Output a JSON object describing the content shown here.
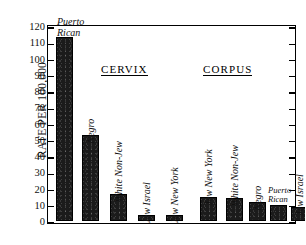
{
  "chart_data": {
    "type": "bar",
    "title": "",
    "xlabel": "",
    "ylabel": "RATE PER 100,000",
    "ylim": [
      0,
      120
    ],
    "ytick_step": 10,
    "yticks": [
      120,
      110,
      100,
      90,
      80,
      70,
      60,
      50,
      40,
      30,
      20,
      10,
      0
    ],
    "grid": false,
    "legend": "none",
    "bar_color": "#1b1b1b",
    "groups": [
      {
        "name": "CERVIX",
        "categories": [
          "Puerto Rican",
          "Negro",
          "White Non-Jew",
          "Jew Israel",
          "Jew New York"
        ],
        "values": [
          113,
          53,
          16.5,
          3.5,
          4
        ]
      },
      {
        "name": "CORPUS",
        "categories": [
          "Jew New York",
          "White Non-Jew",
          "Negro",
          "Puerto Rican",
          "Jew Israel"
        ],
        "values": [
          15,
          14,
          11.5,
          10,
          8.5
        ]
      }
    ],
    "bars": [
      {
        "label": "Puerto Rican",
        "label_lines": [
          "Puerto",
          "Rican"
        ],
        "value": 113,
        "group": "CERVIX",
        "label_orientation": "horizontal"
      },
      {
        "label": "Negro",
        "label_lines": [
          "Negro"
        ],
        "value": 53,
        "group": "CERVIX",
        "label_orientation": "vertical"
      },
      {
        "label": "White Non-Jew",
        "label_lines": [
          "White Non-Jew"
        ],
        "value": 16.5,
        "group": "CERVIX",
        "label_orientation": "vertical"
      },
      {
        "label": "Jew Israel",
        "label_lines": [
          "Jew Israel"
        ],
        "value": 3.5,
        "group": "CERVIX",
        "label_orientation": "vertical"
      },
      {
        "label": "Jew New York",
        "label_lines": [
          "Jew New York"
        ],
        "value": 4,
        "group": "CERVIX",
        "label_orientation": "vertical"
      },
      {
        "label": "Jew New York",
        "label_lines": [
          "Jew New York"
        ],
        "value": 15,
        "group": "CORPUS",
        "label_orientation": "vertical"
      },
      {
        "label": "White Non-Jew",
        "label_lines": [
          "White Non-Jew"
        ],
        "value": 14,
        "group": "CORPUS",
        "label_orientation": "vertical"
      },
      {
        "label": "Negro",
        "label_lines": [
          "Negro"
        ],
        "value": 11.5,
        "group": "CORPUS",
        "label_orientation": "vertical"
      },
      {
        "label": "Puerto Rican",
        "label_lines": [
          "Puerto",
          "Rican"
        ],
        "value": 10,
        "group": "CORPUS",
        "label_orientation": "horizontal-small"
      },
      {
        "label": "Jew Israel",
        "label_lines": [
          "Jew Israel"
        ],
        "value": 8.5,
        "group": "CORPUS",
        "label_orientation": "vertical"
      }
    ]
  },
  "axis": {
    "y_title": "RATE PER 100,000"
  },
  "headings": {
    "cervix": "CERVIX",
    "corpus": "CORPUS"
  }
}
